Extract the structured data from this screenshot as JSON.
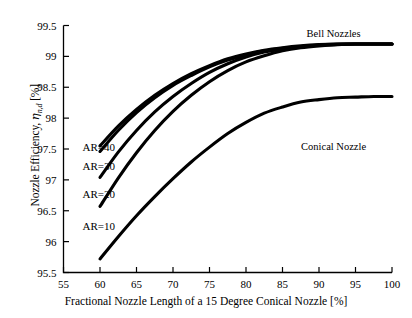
{
  "chart_data": {
    "type": "line",
    "title": "",
    "xlabel": "Fractional Nozzle Length of a 15 Degree Conical Nozzle [%]",
    "ylabel": "Nozzle Efficiency, ηn,d [%]",
    "ylabel_parts": {
      "prefix": "Nozzle Efficiency, ",
      "symbol": "η",
      "subscript": "n,d",
      "suffix": " [%]"
    },
    "xlim": [
      55,
      100
    ],
    "ylim": [
      95.5,
      99.5
    ],
    "xticks": [
      55,
      60,
      65,
      70,
      75,
      80,
      85,
      90,
      95,
      100
    ],
    "yticks": [
      95.5,
      96,
      96.5,
      97,
      97.5,
      98,
      98.5,
      99,
      99.5
    ],
    "xtick_labels": [
      "55",
      "60",
      "65",
      "70",
      "75",
      "80",
      "85",
      "90",
      "95",
      "100"
    ],
    "ytick_labels": [
      "95.5",
      "96",
      "96.5",
      "97",
      "97.5",
      "98",
      "98.5",
      "99",
      "99.5"
    ],
    "grid": false,
    "legend": "none",
    "line_color": "#000000",
    "x": [
      60,
      62.5,
      65,
      67.5,
      70,
      72.5,
      75,
      77.5,
      80,
      82.5,
      85,
      87.5,
      90,
      92.5,
      95,
      97.5,
      100
    ],
    "series": [
      {
        "name": "AR=40",
        "label": "AR=40",
        "values": [
          97.55,
          97.87,
          98.14,
          98.37,
          98.56,
          98.72,
          98.85,
          98.96,
          99.04,
          99.1,
          99.14,
          99.17,
          99.19,
          99.2,
          99.2,
          99.2,
          99.2
        ]
      },
      {
        "name": "AR=30",
        "label": "AR=30",
        "values": [
          97.46,
          97.8,
          98.09,
          98.33,
          98.53,
          98.69,
          98.83,
          98.94,
          99.02,
          99.09,
          99.13,
          99.16,
          99.185,
          99.195,
          99.2,
          99.2,
          99.2
        ]
      },
      {
        "name": "AR=20",
        "label": "AR=20",
        "values": [
          97.04,
          97.45,
          97.8,
          98.1,
          98.35,
          98.56,
          98.74,
          98.88,
          98.99,
          99.07,
          99.12,
          99.16,
          99.18,
          99.195,
          99.2,
          99.2,
          99.2
        ]
      },
      {
        "name": "AR=10",
        "label": "AR=10",
        "values": [
          96.57,
          97.03,
          97.44,
          97.8,
          98.11,
          98.37,
          98.59,
          98.77,
          98.91,
          99.01,
          99.09,
          99.14,
          99.17,
          99.19,
          99.2,
          99.2,
          99.2
        ]
      },
      {
        "name": "Conical Nozzle",
        "label": "Conical Nozzle",
        "values": [
          95.72,
          96.08,
          96.42,
          96.73,
          97.02,
          97.29,
          97.53,
          97.75,
          97.93,
          98.08,
          98.18,
          98.26,
          98.3,
          98.33,
          98.34,
          98.35,
          98.35
        ]
      }
    ],
    "annotations": [
      {
        "text": "Bell Nozzles",
        "x": 92,
        "y": 99.38
      },
      {
        "text": "Conical Nozzle",
        "x": 92,
        "y": 97.55
      },
      {
        "text": "AR=40",
        "x": 57.6,
        "y": 97.53
      },
      {
        "text": "AR=30",
        "x": 57.6,
        "y": 97.22
      },
      {
        "text": "AR=20",
        "x": 57.6,
        "y": 96.77
      },
      {
        "text": "AR=10",
        "x": 57.6,
        "y": 96.25
      }
    ]
  }
}
